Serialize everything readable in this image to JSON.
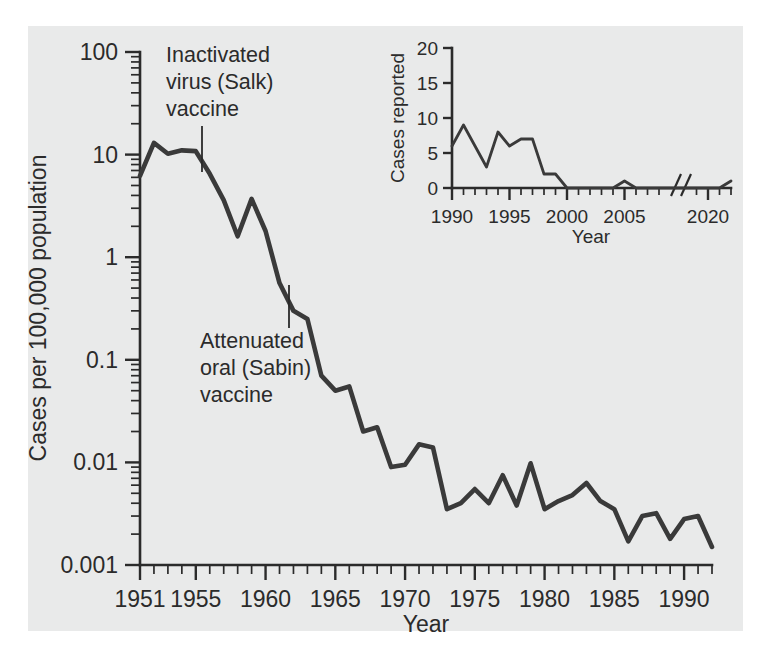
{
  "figure": {
    "background_color": "#e9eaea",
    "page_color": "#ffffff",
    "line_color": "#3a3a3a",
    "axis_color": "#2b2b2b"
  },
  "main_axes": {
    "xlabel": "Year",
    "ylabel": "Cases per 100,000 population",
    "x_tick_labels": [
      "1951",
      "1955",
      "1960",
      "1965",
      "1970",
      "1975",
      "1980",
      "1985",
      "1990"
    ],
    "y_tick_labels": [
      "100",
      "10",
      "1",
      "0.1",
      "0.01",
      "0.001"
    ]
  },
  "inset_axes": {
    "xlabel": "Year",
    "ylabel": "Cases reported",
    "x_tick_labels": [
      "1990",
      "1995",
      "2000",
      "2005",
      "2020"
    ],
    "y_tick_labels": [
      "0",
      "5",
      "10",
      "15",
      "20"
    ]
  },
  "annotations": [
    {
      "id": "salk",
      "lines": [
        "Inactivated",
        "virus (Salk)",
        "vaccine"
      ],
      "points_to_year": 1955
    },
    {
      "id": "sabin",
      "lines": [
        "Attenuated",
        "oral (Sabin)",
        "vaccine"
      ],
      "points_to_year": 1961
    }
  ],
  "chart_data": [
    {
      "id": "main",
      "type": "line",
      "title": "",
      "xlabel": "Year",
      "ylabel": "Cases per 100,000 population",
      "yscale": "log",
      "xlim": [
        1951,
        1992
      ],
      "ylim": [
        0.001,
        100
      ],
      "grid": false,
      "legend": "none",
      "x": [
        1951,
        1952,
        1953,
        1954,
        1955,
        1956,
        1957,
        1958,
        1959,
        1960,
        1961,
        1962,
        1963,
        1964,
        1965,
        1966,
        1967,
        1968,
        1969,
        1970,
        1971,
        1972,
        1973,
        1974,
        1975,
        1976,
        1977,
        1978,
        1979,
        1980,
        1981,
        1982,
        1983,
        1984,
        1985,
        1986,
        1987,
        1988,
        1989,
        1990,
        1991,
        1992
      ],
      "values": [
        6.2,
        13.0,
        10.2,
        11.0,
        10.8,
        6.5,
        3.6,
        1.6,
        3.7,
        1.8,
        0.56,
        0.3,
        0.25,
        0.07,
        0.05,
        0.055,
        0.02,
        0.022,
        0.009,
        0.0095,
        0.015,
        0.014,
        0.0035,
        0.004,
        0.0055,
        0.004,
        0.0075,
        0.0038,
        0.0098,
        0.0035,
        0.0042,
        0.0048,
        0.0063,
        0.0042,
        0.0035,
        0.0017,
        0.003,
        0.0032,
        0.0018,
        0.0028,
        0.003,
        0.0015
      ]
    },
    {
      "id": "inset",
      "type": "line",
      "title": "",
      "xlabel": "Year",
      "ylabel": "Cases reported",
      "yscale": "linear",
      "ylim": [
        0,
        20
      ],
      "grid": false,
      "legend": "none",
      "axis_break": true,
      "x": [
        1990,
        1991,
        1992,
        1993,
        1994,
        1995,
        1996,
        1997,
        1998,
        1999,
        2000,
        2001,
        2002,
        2003,
        2004,
        2005,
        2006,
        2007,
        2008,
        2020,
        2021,
        2022
      ],
      "values": [
        6,
        9,
        6,
        3,
        8,
        6,
        7,
        7,
        2,
        2,
        0,
        0,
        0,
        0,
        0,
        1,
        0,
        0,
        0,
        0,
        0,
        1
      ]
    }
  ]
}
